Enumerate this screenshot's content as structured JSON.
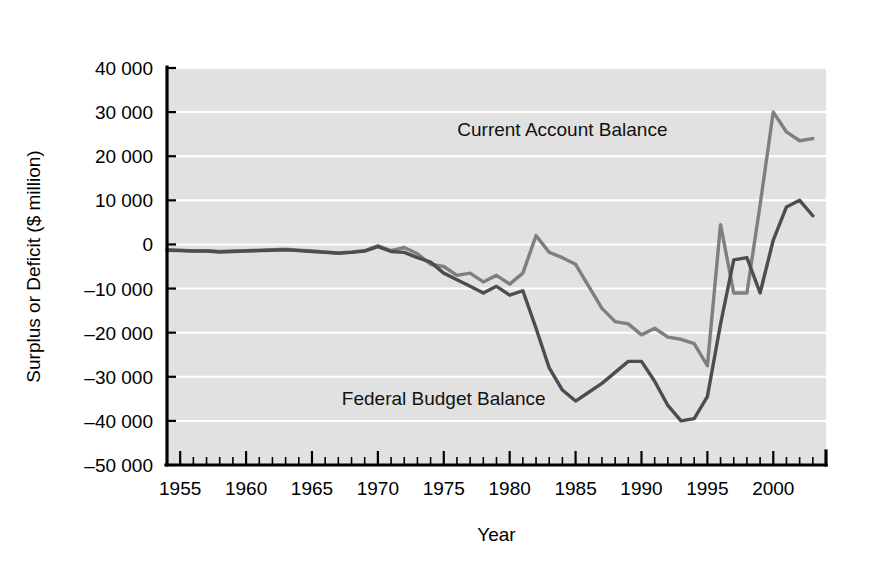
{
  "chart_data": {
    "type": "line",
    "title": "",
    "xlabel": "Year",
    "ylabel": "Surplus or Deficit ($ million)",
    "xlim": [
      1954,
      2004
    ],
    "ylim": [
      -50000,
      40000
    ],
    "grid": true,
    "legend_position": "inline-annotation",
    "y_ticks": [
      40000,
      30000,
      20000,
      10000,
      0,
      -10000,
      -20000,
      -30000,
      -40000,
      -50000
    ],
    "y_tick_labels": [
      "40 000",
      "30 000",
      "20 000",
      "10 000",
      "0",
      "–10 000",
      "–20 000",
      "–30 000",
      "–40 000",
      "–50 000"
    ],
    "x_ticks": [
      1955,
      1960,
      1965,
      1970,
      1975,
      1980,
      1985,
      1990,
      1995,
      2000
    ],
    "x_tick_labels": [
      "1955",
      "1960",
      "1965",
      "1970",
      "1975",
      "1980",
      "1985",
      "1990",
      "1995",
      "2000"
    ],
    "x_minor_tick_step": 1,
    "series": [
      {
        "name": "Current Account Balance",
        "color": "#7f7f7f",
        "label_x": 1984,
        "label_y": 24500,
        "x": [
          1954,
          1955,
          1956,
          1957,
          1958,
          1959,
          1960,
          1961,
          1962,
          1963,
          1964,
          1965,
          1966,
          1967,
          1968,
          1969,
          1970,
          1971,
          1972,
          1973,
          1974,
          1975,
          1976,
          1977,
          1978,
          1979,
          1980,
          1981,
          1982,
          1983,
          1984,
          1985,
          1986,
          1987,
          1988,
          1989,
          1990,
          1991,
          1992,
          1993,
          1994,
          1995,
          1996,
          1997,
          1998,
          1999,
          2000,
          2001,
          2002,
          2003
        ],
        "values": [
          -1200,
          -1300,
          -1500,
          -1400,
          -1600,
          -1500,
          -1400,
          -1300,
          -1200,
          -1100,
          -1300,
          -1500,
          -1700,
          -1900,
          -1700,
          -1400,
          -300,
          -1400,
          -700,
          -2100,
          -4500,
          -5000,
          -7000,
          -6500,
          -8500,
          -7000,
          -9000,
          -6500,
          2000,
          -1800,
          -3000,
          -4500,
          -9500,
          -14500,
          -17500,
          -18000,
          -20500,
          -19000,
          -21000,
          -21500,
          -22500,
          -27500,
          4500,
          -11000,
          -11000,
          9000,
          30000,
          25500,
          23500,
          24000
        ]
      },
      {
        "name": "Federal Budget Balance",
        "color": "#4d4d4d",
        "label_x": 1975,
        "label_y": -36500,
        "x": [
          1954,
          1955,
          1956,
          1957,
          1958,
          1959,
          1960,
          1961,
          1962,
          1963,
          1964,
          1965,
          1966,
          1967,
          1968,
          1969,
          1970,
          1971,
          1972,
          1973,
          1974,
          1975,
          1976,
          1977,
          1978,
          1979,
          1980,
          1981,
          1982,
          1983,
          1984,
          1985,
          1986,
          1987,
          1988,
          1989,
          1990,
          1991,
          1992,
          1993,
          1994,
          1995,
          1996,
          1997,
          1998,
          1999,
          2000,
          2001,
          2002,
          2003
        ],
        "values": [
          -1300,
          -1400,
          -1500,
          -1500,
          -1700,
          -1600,
          -1500,
          -1400,
          -1300,
          -1200,
          -1400,
          -1600,
          -1800,
          -2000,
          -1800,
          -1500,
          -500,
          -1600,
          -1800,
          -3000,
          -4000,
          -6500,
          -8000,
          -9500,
          -11000,
          -9500,
          -11500,
          -10500,
          -19000,
          -28000,
          -33000,
          -35500,
          -33500,
          -31500,
          -29000,
          -26500,
          -26500,
          -31000,
          -36500,
          -40000,
          -39500,
          -34500,
          -18000,
          -3500,
          -3000,
          -11000,
          1000,
          8500,
          10000,
          6500
        ]
      }
    ]
  }
}
